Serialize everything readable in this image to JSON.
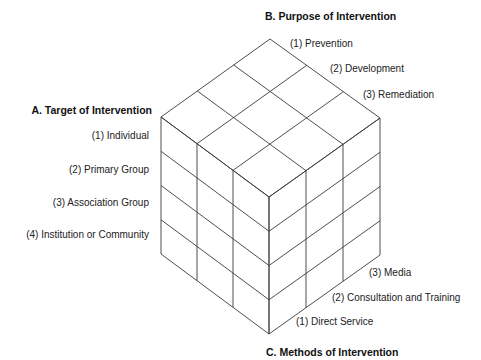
{
  "diagram": {
    "type": "cube",
    "axes": {
      "A": {
        "title": "A. Target of Intervention",
        "items": [
          "(1) Individual",
          "(2) Primary Group",
          "(3) Association Group",
          "(4) Institution or Community"
        ]
      },
      "B": {
        "title": "B. Purpose of Intervention",
        "items": [
          "(1) Prevention",
          "(2) Development",
          "(3) Remediation"
        ]
      },
      "C": {
        "title": "C. Methods of Intervention",
        "items": [
          "(1) Direct Service",
          "(2) Consultation and Training",
          "(3) Media"
        ]
      }
    },
    "grid": {
      "rows": 4,
      "columns_left": 3,
      "columns_right": 3
    },
    "line_color": "#3a3a3a"
  }
}
